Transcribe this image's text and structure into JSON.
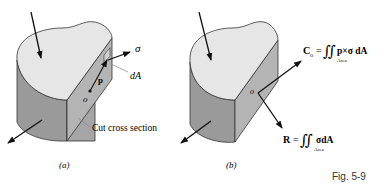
{
  "figure": {
    "caption": "Fig. 5-9",
    "colors": {
      "top_face": "#e6e6e6",
      "side_face": "#9a9a9a",
      "cut_face": "#b0b0b0",
      "edge": "#333333",
      "arrow": "#111111",
      "leader": "#888888"
    }
  },
  "panel_a": {
    "label": "(a)",
    "stress_label": "σ",
    "area_label": "dA",
    "position_label": "p",
    "origin_label": "o",
    "cut_label": "Cut cross section"
  },
  "panel_b": {
    "label": "(b)",
    "origin_label": "o",
    "moment": {
      "lhs": "C",
      "lhs_sub": "o",
      "equals": "=",
      "integral": "∬",
      "integrand": "p×σ dA",
      "domain": "Area"
    },
    "resultant": {
      "lhs": "R",
      "equals": "=",
      "integral": "∬",
      "integrand": "σdA",
      "domain": "Area"
    }
  }
}
